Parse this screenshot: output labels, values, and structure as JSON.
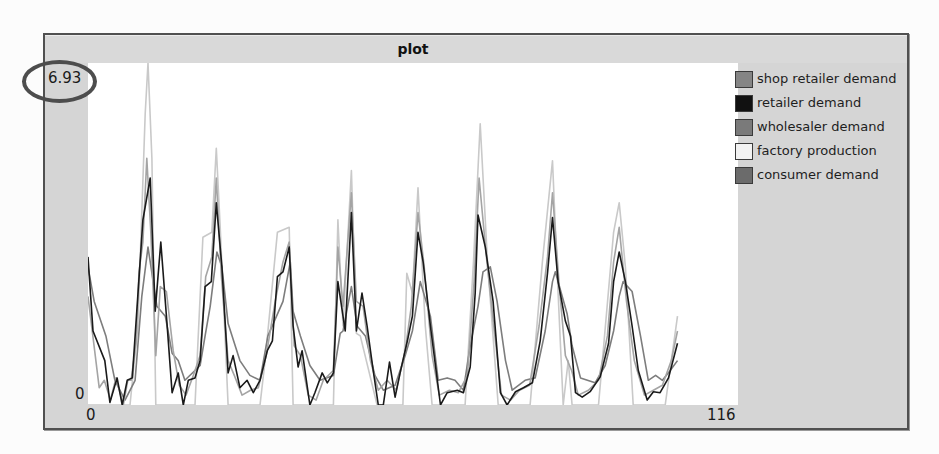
{
  "plot": {
    "title": "plot",
    "y_max_label": "6.93",
    "y_min_label": "0",
    "x_min_label": "0",
    "x_max_label": "116"
  },
  "legend": {
    "items": [
      {
        "label": "shop retailer demand",
        "color": "#858585"
      },
      {
        "label": "retailer demand",
        "color": "#111111"
      },
      {
        "label": "wholesaler demand",
        "color": "#7a7a7a"
      },
      {
        "label": "factory production",
        "color": "#f2f2f2"
      },
      {
        "label": "consumer demand",
        "color": "#6b6b6b"
      }
    ]
  },
  "annotation": {
    "highlighted_value": "6.93"
  },
  "chart_data": {
    "type": "line",
    "title": "plot",
    "xlabel": "",
    "ylabel": "",
    "xlim": [
      0,
      116
    ],
    "ylim": [
      0,
      6.93
    ],
    "x_tick_labels": [
      "0",
      "116"
    ],
    "y_tick_labels": [
      "0",
      "6.93"
    ],
    "grid": false,
    "legend_position": "right",
    "series": [
      {
        "name": "shop retailer demand",
        "line_color": "#a4a4a4",
        "points": [
          [
            0,
            2.2
          ],
          [
            2.0,
            0.35
          ],
          [
            2.9,
            0.5
          ],
          [
            4.0,
            0.1
          ],
          [
            5.0,
            0.55
          ],
          [
            6.3,
            0
          ],
          [
            7.1,
            0.5
          ],
          [
            7.7,
            0.5
          ],
          [
            8.6,
            1.3
          ],
          [
            9.1,
            2.7
          ],
          [
            9.8,
            3.3
          ],
          [
            10.5,
            5.0
          ],
          [
            11.2,
            3.5
          ],
          [
            12.1,
            1.0
          ],
          [
            12.9,
            2.4
          ],
          [
            14.0,
            2.3
          ],
          [
            15.2,
            1.1
          ],
          [
            16.3,
            0.4
          ],
          [
            17.5,
            0.2
          ],
          [
            18.8,
            0.6
          ],
          [
            20.0,
            1.0
          ],
          [
            21.0,
            2.6
          ],
          [
            22.1,
            3.0
          ],
          [
            22.9,
            4.6
          ],
          [
            23.8,
            2.6
          ],
          [
            25.0,
            0.9
          ],
          [
            26.1,
            0.6
          ],
          [
            27.5,
            0.2
          ],
          [
            29.0,
            0.3
          ],
          [
            30.4,
            0.35
          ],
          [
            31.8,
            1.0
          ],
          [
            33.4,
            2.1
          ],
          [
            34.8,
            2.9
          ],
          [
            35.9,
            3.3
          ],
          [
            36.8,
            1.2
          ],
          [
            37.9,
            1.0
          ],
          [
            39.3,
            0.2
          ],
          [
            40.7,
            0.1
          ],
          [
            42.0,
            0.5
          ],
          [
            43.8,
            0.7
          ],
          [
            44.6,
            3.2
          ],
          [
            45.5,
            2.0
          ],
          [
            47.0,
            4.3
          ],
          [
            47.9,
            2.1
          ],
          [
            49.1,
            2.0
          ],
          [
            50.4,
            0.9
          ],
          [
            51.8,
            0.3
          ],
          [
            53.4,
            0.5
          ],
          [
            55.0,
            0.3
          ],
          [
            56.6,
            1.1
          ],
          [
            57.7,
            2.0
          ],
          [
            58.9,
            3.9
          ],
          [
            60.0,
            2.8
          ],
          [
            61.4,
            1.0
          ],
          [
            62.7,
            0.2
          ],
          [
            64.5,
            0.3
          ],
          [
            66.1,
            0.25
          ],
          [
            67.7,
            0.6
          ],
          [
            68.9,
            2.5
          ],
          [
            69.8,
            4.6
          ],
          [
            71.1,
            3.0
          ],
          [
            72.5,
            1.5
          ],
          [
            73.8,
            0.2
          ],
          [
            75.4,
            0.1
          ],
          [
            77.0,
            0.3
          ],
          [
            78.8,
            0.4
          ],
          [
            80.5,
            1.6
          ],
          [
            82.0,
            3.0
          ],
          [
            82.9,
            4.3
          ],
          [
            84.1,
            2.4
          ],
          [
            85.2,
            1.0
          ],
          [
            86.3,
            0.7
          ],
          [
            87.5,
            0.2
          ],
          [
            89.3,
            0.3
          ],
          [
            91.1,
            0.5
          ],
          [
            92.7,
            1.4
          ],
          [
            93.8,
            2.9
          ],
          [
            94.8,
            3.6
          ],
          [
            96.1,
            2.1
          ],
          [
            97.5,
            0.9
          ],
          [
            99.3,
            0.2
          ],
          [
            100.9,
            0.3
          ],
          [
            102.5,
            0.4
          ],
          [
            104.1,
            0.9
          ],
          [
            105.2,
            1.5
          ]
        ]
      },
      {
        "name": "retailer demand",
        "line_color": "#1a1a1a",
        "points": [
          [
            0,
            3.0
          ],
          [
            0.9,
            1.5
          ],
          [
            3.0,
            0.9
          ],
          [
            3.9,
            0.05
          ],
          [
            5.2,
            0.55
          ],
          [
            6.1,
            0
          ],
          [
            7.0,
            0.5
          ],
          [
            7.9,
            0.55
          ],
          [
            9.3,
            2.9
          ],
          [
            9.8,
            3.75
          ],
          [
            11.1,
            4.6
          ],
          [
            12.0,
            1.9
          ],
          [
            13.0,
            3.3
          ],
          [
            14.1,
            1.65
          ],
          [
            15.0,
            0.25
          ],
          [
            16.1,
            0.65
          ],
          [
            17.0,
            0
          ],
          [
            17.9,
            0.5
          ],
          [
            19.1,
            0.55
          ],
          [
            20.0,
            0.9
          ],
          [
            20.9,
            2.4
          ],
          [
            22.0,
            2.5
          ],
          [
            22.9,
            4.1
          ],
          [
            23.9,
            2.8
          ],
          [
            25.0,
            0.65
          ],
          [
            25.9,
            1.0
          ],
          [
            27.1,
            0.35
          ],
          [
            28.4,
            0.5
          ],
          [
            29.5,
            0.25
          ],
          [
            30.7,
            0.5
          ],
          [
            32.0,
            1.1
          ],
          [
            32.9,
            1.3
          ],
          [
            33.8,
            2.6
          ],
          [
            34.8,
            2.7
          ],
          [
            35.9,
            3.2
          ],
          [
            36.6,
            1.6
          ],
          [
            37.5,
            0.77
          ],
          [
            38.2,
            1.1
          ],
          [
            39.6,
            0
          ],
          [
            40.5,
            0.25
          ],
          [
            41.8,
            0.65
          ],
          [
            42.7,
            0.45
          ],
          [
            43.8,
            0.65
          ],
          [
            44.6,
            2.5
          ],
          [
            45.9,
            1.5
          ],
          [
            47.0,
            3.9
          ],
          [
            47.9,
            1.5
          ],
          [
            48.9,
            2.27
          ],
          [
            49.8,
            1.6
          ],
          [
            50.9,
            0.7
          ],
          [
            51.8,
            0
          ],
          [
            52.7,
            0
          ],
          [
            53.8,
            0.87
          ],
          [
            54.8,
            0.16
          ],
          [
            55.7,
            0.65
          ],
          [
            57.0,
            1.3
          ],
          [
            57.9,
            1.8
          ],
          [
            58.9,
            3.5
          ],
          [
            59.8,
            2.9
          ],
          [
            61.1,
            1.6
          ],
          [
            62.9,
            0
          ],
          [
            64.1,
            0.25
          ],
          [
            65.9,
            0.3
          ],
          [
            67.0,
            0.25
          ],
          [
            68.2,
            0.77
          ],
          [
            69.1,
            2.27
          ],
          [
            69.6,
            3.85
          ],
          [
            70.9,
            3.2
          ],
          [
            72.3,
            2.1
          ],
          [
            73.6,
            0.25
          ],
          [
            74.8,
            0
          ],
          [
            76.3,
            0.27
          ],
          [
            77.7,
            0.35
          ],
          [
            79.3,
            0.45
          ],
          [
            80.7,
            1.3
          ],
          [
            82.0,
            2.67
          ],
          [
            82.9,
            3.8
          ],
          [
            83.9,
            2.5
          ],
          [
            85.2,
            1.7
          ],
          [
            86.1,
            1.4
          ],
          [
            87.0,
            0.25
          ],
          [
            88.2,
            0.16
          ],
          [
            89.6,
            0.27
          ],
          [
            91.4,
            0.57
          ],
          [
            92.9,
            1.25
          ],
          [
            93.8,
            2.5
          ],
          [
            94.8,
            3.1
          ],
          [
            95.9,
            2.5
          ],
          [
            97.1,
            1.6
          ],
          [
            98.2,
            0.7
          ],
          [
            99.8,
            0.1
          ],
          [
            100.9,
            0.27
          ],
          [
            102.1,
            0.25
          ],
          [
            103.6,
            0.55
          ],
          [
            105.2,
            1.25
          ]
        ]
      },
      {
        "name": "wholesaler demand",
        "line_color": "#7d7d7d",
        "points": [
          [
            0,
            2.8
          ],
          [
            1.1,
            2.1
          ],
          [
            3.2,
            1.4
          ],
          [
            4.8,
            0.5
          ],
          [
            6.6,
            0.1
          ],
          [
            8.4,
            0.5
          ],
          [
            9.6,
            2.2
          ],
          [
            10.7,
            3.2
          ],
          [
            12.3,
            2.0
          ],
          [
            13.8,
            1.8
          ],
          [
            15.0,
            1.05
          ],
          [
            16.1,
            0.9
          ],
          [
            17.3,
            0.5
          ],
          [
            20.0,
            0.8
          ],
          [
            20.9,
            1.4
          ],
          [
            21.8,
            2.0
          ],
          [
            23.0,
            3.1
          ],
          [
            23.9,
            2.8
          ],
          [
            25.0,
            1.65
          ],
          [
            27.1,
            0.9
          ],
          [
            28.9,
            0.6
          ],
          [
            30.7,
            0.5
          ],
          [
            32.1,
            1.4
          ],
          [
            34.8,
            2.1
          ],
          [
            36.1,
            2.9
          ],
          [
            36.6,
            1.9
          ],
          [
            37.9,
            1.4
          ],
          [
            39.6,
            0.8
          ],
          [
            41.4,
            0.5
          ],
          [
            43.8,
            0.6
          ],
          [
            45.0,
            1.45
          ],
          [
            45.5,
            1.5
          ],
          [
            47.0,
            2.4
          ],
          [
            48.0,
            1.6
          ],
          [
            49.5,
            1.4
          ],
          [
            51.2,
            0.6
          ],
          [
            52.7,
            0.3
          ],
          [
            54.8,
            0.4
          ],
          [
            56.6,
            1.0
          ],
          [
            57.9,
            1.5
          ],
          [
            59.3,
            2.5
          ],
          [
            61.1,
            1.8
          ],
          [
            62.5,
            0.5
          ],
          [
            64.1,
            0.55
          ],
          [
            65.5,
            0.5
          ],
          [
            67.0,
            0.3
          ],
          [
            68.2,
            1.2
          ],
          [
            69.6,
            2.0
          ],
          [
            70.5,
            2.7
          ],
          [
            71.8,
            2.8
          ],
          [
            73.0,
            2.1
          ],
          [
            74.5,
            0.9
          ],
          [
            75.7,
            0.3
          ],
          [
            78.0,
            0.5
          ],
          [
            79.8,
            0.55
          ],
          [
            81.6,
            1.5
          ],
          [
            82.9,
            2.5
          ],
          [
            83.4,
            2.7
          ],
          [
            85.5,
            1.85
          ],
          [
            86.4,
            1.2
          ],
          [
            87.9,
            0.55
          ],
          [
            90.5,
            0.45
          ],
          [
            92.3,
            0.8
          ],
          [
            93.8,
            1.5
          ],
          [
            94.8,
            2.2
          ],
          [
            95.5,
            2.5
          ],
          [
            97.1,
            2.3
          ],
          [
            98.6,
            1.4
          ],
          [
            100.0,
            0.5
          ],
          [
            101.3,
            0.6
          ],
          [
            102.5,
            0.5
          ],
          [
            103.9,
            0.7
          ],
          [
            105.2,
            0.9
          ]
        ]
      },
      {
        "name": "factory production",
        "line_color": "#c9c9c9",
        "points": [
          [
            0,
            0
          ],
          [
            7.5,
            0
          ],
          [
            8.9,
            1.6
          ],
          [
            10.2,
            5.9
          ],
          [
            10.7,
            6.93
          ],
          [
            11.4,
            5.0
          ],
          [
            12.1,
            0
          ],
          [
            19.1,
            0
          ],
          [
            20.5,
            3.4
          ],
          [
            22.1,
            3.5
          ],
          [
            22.9,
            5.2
          ],
          [
            23.6,
            3.6
          ],
          [
            25.0,
            0
          ],
          [
            30.7,
            0
          ],
          [
            31.6,
            0.9
          ],
          [
            33.8,
            3.5
          ],
          [
            35.9,
            3.6
          ],
          [
            36.6,
            0
          ],
          [
            43.8,
            0
          ],
          [
            44.6,
            3.75
          ],
          [
            45.5,
            1.6
          ],
          [
            47.0,
            4.75
          ],
          [
            47.9,
            1.45
          ],
          [
            48.6,
            1.4
          ],
          [
            51.6,
            0
          ],
          [
            56.2,
            0
          ],
          [
            56.9,
            2.67
          ],
          [
            57.9,
            2.27
          ],
          [
            58.9,
            4.4
          ],
          [
            60.2,
            1.6
          ],
          [
            61.4,
            0
          ],
          [
            67.3,
            0
          ],
          [
            68.8,
            2.9
          ],
          [
            70.0,
            5.7
          ],
          [
            71.3,
            2.9
          ],
          [
            73.2,
            0
          ],
          [
            78.9,
            0
          ],
          [
            81.1,
            2.9
          ],
          [
            82.9,
            4.95
          ],
          [
            83.9,
            2.27
          ],
          [
            84.8,
            0
          ],
          [
            85.7,
            0.9
          ],
          [
            86.4,
            0
          ],
          [
            91.1,
            0
          ],
          [
            93.8,
            3.5
          ],
          [
            94.8,
            4.1
          ],
          [
            95.9,
            2.8
          ],
          [
            97.3,
            0
          ],
          [
            103.0,
            0
          ],
          [
            105.2,
            1.8
          ]
        ]
      },
      {
        "name": "consumer demand",
        "line_color": "#6b6b6b",
        "points": []
      }
    ]
  }
}
